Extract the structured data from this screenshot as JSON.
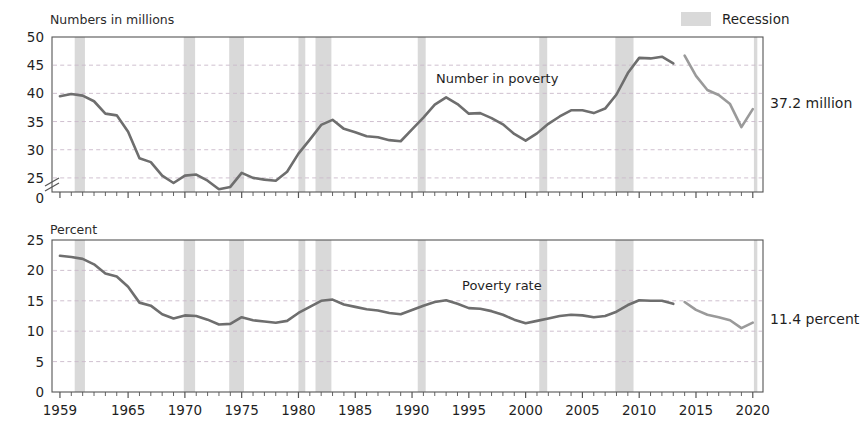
{
  "legend": {
    "recession_label": "Recession",
    "recession_color": "#d9d9d9"
  },
  "series_color": "#6e6e6e",
  "grid_color": "#c9b9c9",
  "axis_color": "#555555",
  "panels": {
    "top": {
      "axis_title": "Numbers in millions",
      "series_label": "Number in poverty",
      "endpoint_label": "37.2 million",
      "yticks": [
        "0",
        "25",
        "30",
        "35",
        "40",
        "45",
        "50"
      ],
      "broken_axis": true
    },
    "bottom": {
      "axis_title": "Percent",
      "series_label": "Poverty rate",
      "endpoint_label": "11.4 percent",
      "yticks": [
        "0",
        "5",
        "10",
        "15",
        "20",
        "25"
      ],
      "broken_axis": false
    }
  },
  "xticks": [
    "1959",
    "1965",
    "1970",
    "1975",
    "1980",
    "1985",
    "1990",
    "1995",
    "2000",
    "2005",
    "2010",
    "2015",
    "2020"
  ],
  "chart_data": {
    "type": "line",
    "xlabel": "",
    "x": [
      1959,
      1960,
      1961,
      1962,
      1963,
      1964,
      1965,
      1966,
      1967,
      1968,
      1969,
      1970,
      1971,
      1972,
      1973,
      1974,
      1975,
      1976,
      1977,
      1978,
      1979,
      1980,
      1981,
      1982,
      1983,
      1984,
      1985,
      1986,
      1987,
      1988,
      1989,
      1990,
      1991,
      1992,
      1993,
      1994,
      1995,
      1996,
      1997,
      1998,
      1999,
      2000,
      2001,
      2002,
      2003,
      2004,
      2005,
      2006,
      2007,
      2008,
      2009,
      2010,
      2011,
      2012,
      2013,
      2014,
      2015,
      2016,
      2017,
      2018,
      2019,
      2020
    ],
    "grid": true,
    "legend_position": "top-right",
    "recessions": [
      {
        "start": 1960.3,
        "end": 1961.2
      },
      {
        "start": 1969.9,
        "end": 1970.9
      },
      {
        "start": 1973.9,
        "end": 1975.2
      },
      {
        "start": 1980.0,
        "end": 1980.6
      },
      {
        "start": 1981.5,
        "end": 1982.9
      },
      {
        "start": 1990.5,
        "end": 1991.2
      },
      {
        "start": 2001.2,
        "end": 2001.9
      },
      {
        "start": 2007.9,
        "end": 2009.5
      },
      {
        "start": 2020.1,
        "end": 2020.4
      }
    ],
    "series": [
      {
        "name": "Number in poverty",
        "panel": "top",
        "ylabel": "Numbers in millions",
        "ylim": [
          22.5,
          50
        ],
        "units": "millions",
        "values": [
          39.5,
          39.9,
          39.6,
          38.6,
          36.4,
          36.1,
          33.2,
          28.5,
          27.8,
          25.4,
          24.1,
          25.4,
          25.6,
          24.5,
          23.0,
          23.4,
          25.9,
          25.0,
          24.7,
          24.5,
          26.1,
          29.3,
          31.8,
          34.4,
          35.3,
          33.7,
          33.1,
          32.4,
          32.2,
          31.7,
          31.5,
          33.6,
          35.7,
          38.0,
          39.3,
          38.1,
          36.4,
          36.5,
          35.6,
          34.5,
          32.8,
          31.6,
          32.9,
          34.6,
          35.9,
          37.0,
          37.0,
          36.5,
          37.3,
          39.8,
          43.6,
          46.3,
          46.2,
          46.5,
          45.3,
          46.7,
          43.1,
          40.6,
          39.7,
          38.1,
          34.0,
          37.2
        ]
      },
      {
        "name": "Poverty rate",
        "panel": "bottom",
        "ylabel": "Percent",
        "ylim": [
          0,
          25
        ],
        "units": "percent",
        "values": [
          22.4,
          22.2,
          21.9,
          21.0,
          19.5,
          19.0,
          17.3,
          14.7,
          14.2,
          12.8,
          12.1,
          12.6,
          12.5,
          11.9,
          11.1,
          11.2,
          12.3,
          11.8,
          11.6,
          11.4,
          11.7,
          13.0,
          14.0,
          15.0,
          15.2,
          14.4,
          14.0,
          13.6,
          13.4,
          13.0,
          12.8,
          13.5,
          14.2,
          14.8,
          15.1,
          14.5,
          13.8,
          13.7,
          13.3,
          12.7,
          11.9,
          11.3,
          11.7,
          12.1,
          12.5,
          12.7,
          12.6,
          12.3,
          12.5,
          13.2,
          14.3,
          15.1,
          15.0,
          15.0,
          14.5,
          14.8,
          13.5,
          12.7,
          12.3,
          11.8,
          10.5,
          11.4
        ]
      }
    ],
    "break_year": 2013,
    "annotations": [
      {
        "text": "37.2 million",
        "panel": "top",
        "type": "endpoint"
      },
      {
        "text": "11.4 percent",
        "panel": "bottom",
        "type": "endpoint"
      }
    ]
  }
}
